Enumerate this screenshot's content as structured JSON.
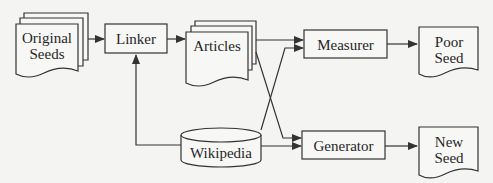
{
  "diagram": {
    "type": "flowchart",
    "colors": {
      "background": "#f4f4f2",
      "stroke": "#333333",
      "fill": "#f7f7f5",
      "text": "#262626"
    },
    "nodes": [
      {
        "id": "original_seeds",
        "shape": "stacked-document",
        "label_line1": "Original",
        "label_line2": "Seeds"
      },
      {
        "id": "linker",
        "shape": "rectangle",
        "label": "Linker"
      },
      {
        "id": "articles",
        "shape": "stacked-document",
        "label": "Articles"
      },
      {
        "id": "wikipedia",
        "shape": "cylinder",
        "label": "Wikipedia"
      },
      {
        "id": "measurer",
        "shape": "rectangle",
        "label": "Measurer"
      },
      {
        "id": "generator",
        "shape": "rectangle",
        "label": "Generator"
      },
      {
        "id": "poor_seed",
        "shape": "document",
        "label_line1": "Poor",
        "label_line2": "Seed"
      },
      {
        "id": "new_seed",
        "shape": "document",
        "label_line1": "New",
        "label_line2": "Seed"
      }
    ],
    "edges": [
      {
        "from": "original_seeds",
        "to": "linker"
      },
      {
        "from": "linker",
        "to": "articles"
      },
      {
        "from": "wikipedia",
        "to": "linker"
      },
      {
        "from": "articles",
        "to": "measurer"
      },
      {
        "from": "articles",
        "to": "generator"
      },
      {
        "from": "wikipedia",
        "to": "measurer"
      },
      {
        "from": "wikipedia",
        "to": "generator"
      },
      {
        "from": "measurer",
        "to": "poor_seed"
      },
      {
        "from": "generator",
        "to": "new_seed"
      }
    ]
  }
}
